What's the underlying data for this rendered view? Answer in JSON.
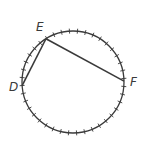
{
  "diagram": {
    "type": "circle-with-chords",
    "tick_count": 40,
    "points": [
      {
        "label": "E",
        "angle_deg": 122
      },
      {
        "label": "D",
        "angle_deg": 184
      },
      {
        "label": "F",
        "angle_deg": 1
      }
    ],
    "chords": [
      {
        "from": "D",
        "to": "E"
      },
      {
        "from": "E",
        "to": "F"
      }
    ],
    "colors": {
      "stroke": "#3a3a3a",
      "background": "#ffffff"
    }
  }
}
